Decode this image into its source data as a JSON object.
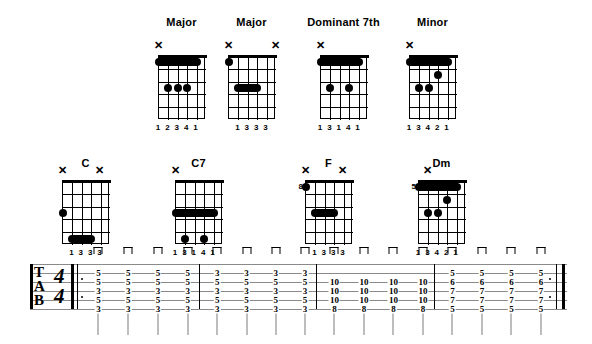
{
  "page": {
    "background": "#ffffff",
    "ink": "#000000",
    "staff_line_color": "#8a8a8a"
  },
  "chord_rows": [
    {
      "row": "shapes",
      "chords": [
        {
          "name": "Major",
          "position_label": "",
          "string_markers": [
            "x",
            "",
            "",
            "",
            "",
            ""
          ],
          "barre": {
            "fret": 1,
            "from_string": 1,
            "to_string": 5
          },
          "dots": [
            {
              "string": 2,
              "fret": 3
            },
            {
              "string": 3,
              "fret": 3
            },
            {
              "string": 4,
              "fret": 3
            }
          ],
          "fingering": [
            "1",
            "2",
            "3",
            "4",
            "1"
          ]
        },
        {
          "name": "Major",
          "position_label": "",
          "string_markers": [
            "x",
            "",
            "",
            "",
            "",
            "x"
          ],
          "barre": {
            "fret": 3,
            "from_string": 2,
            "to_string": 4
          },
          "dots": [
            {
              "string": 1,
              "fret": 1
            }
          ],
          "fingering": [
            "1",
            "3",
            "3",
            "3"
          ]
        },
        {
          "name": "Dominant 7th",
          "position_label": "",
          "string_markers": [
            "x",
            "",
            "",
            "",
            "",
            ""
          ],
          "barre": {
            "fret": 1,
            "from_string": 1,
            "to_string": 5
          },
          "dots": [
            {
              "string": 2,
              "fret": 3
            },
            {
              "string": 4,
              "fret": 3
            }
          ],
          "fingering": [
            "1",
            "3",
            "1",
            "4",
            "1"
          ]
        },
        {
          "name": "Minor",
          "position_label": "",
          "string_markers": [
            "x",
            "",
            "",
            "",
            "",
            ""
          ],
          "barre": {
            "fret": 1,
            "from_string": 1,
            "to_string": 5
          },
          "dots": [
            {
              "string": 2,
              "fret": 3
            },
            {
              "string": 3,
              "fret": 3
            },
            {
              "string": 4,
              "fret": 2
            }
          ],
          "fingering": [
            "1",
            "3",
            "4",
            "2",
            "1"
          ]
        }
      ]
    },
    {
      "row": "named",
      "chords": [
        {
          "name": "C",
          "position_label": "",
          "string_markers": [
            "x",
            "",
            "",
            "",
            "x",
            ""
          ],
          "barre": {
            "fret": 5,
            "from_string": 2,
            "to_string": 4
          },
          "dots": [
            {
              "string": 1,
              "fret": 3
            }
          ],
          "fingering": [
            "1",
            "3",
            "3",
            "3"
          ]
        },
        {
          "name": "C7",
          "position_label": "",
          "string_markers": [
            "x",
            "",
            "",
            "",
            "",
            ""
          ],
          "barre": {
            "fret": 3,
            "from_string": 1,
            "to_string": 5
          },
          "dots": [
            {
              "string": 2,
              "fret": 5
            },
            {
              "string": 4,
              "fret": 5
            }
          ],
          "fingering": [
            "1",
            "3",
            "1",
            "4",
            "1"
          ]
        },
        {
          "name": "F",
          "position_label": "8",
          "string_markers": [
            "x",
            "",
            "",
            "",
            "x",
            ""
          ],
          "barre": {
            "fret": 3,
            "from_string": 2,
            "to_string": 4
          },
          "dots": [
            {
              "string": 1,
              "fret": 1
            }
          ],
          "fingering": [
            "1",
            "3",
            "3",
            "3"
          ]
        },
        {
          "name": "Dm",
          "position_label": "5",
          "string_markers": [
            "",
            "x",
            "",
            "",
            "",
            ""
          ],
          "barre": {
            "fret": 1,
            "from_string": 1,
            "to_string": 5
          },
          "dots": [
            {
              "string": 2,
              "fret": 3
            },
            {
              "string": 3,
              "fret": 3
            },
            {
              "string": 4,
              "fret": 2
            }
          ],
          "fingering": [
            "1",
            "3",
            "4",
            "2",
            "1"
          ]
        }
      ]
    }
  ],
  "tab": {
    "clef": [
      "T",
      "A",
      "B"
    ],
    "time_signature": {
      "top": "4",
      "bottom": "4"
    },
    "repeat_start": true,
    "repeat_end": true,
    "strings": 6,
    "measures": [
      {
        "index": 1,
        "chord_ref": "C",
        "beats": [
          {
            "strum": "down",
            "frets": [
              "5",
              "5",
              "3",
              "5",
              "3"
            ]
          },
          {
            "strum": "down",
            "frets": [
              "5",
              "5",
              "3",
              "5",
              "3"
            ]
          },
          {
            "strum": "down",
            "frets": [
              "5",
              "5",
              "3",
              "5",
              "3"
            ]
          },
          {
            "strum": "down",
            "frets": [
              "5",
              "5",
              "3",
              "5",
              "3"
            ]
          }
        ]
      },
      {
        "index": 2,
        "chord_ref": "C7",
        "beats": [
          {
            "strum": "down",
            "frets": [
              "3",
              "5",
              "3",
              "5",
              "3"
            ]
          },
          {
            "strum": "down",
            "frets": [
              "3",
              "5",
              "3",
              "5",
              "3"
            ]
          },
          {
            "strum": "down",
            "frets": [
              "3",
              "5",
              "3",
              "5",
              "3"
            ]
          },
          {
            "strum": "down",
            "frets": [
              "3",
              "5",
              "3",
              "5",
              "3"
            ]
          }
        ]
      },
      {
        "index": 3,
        "chord_ref": "F",
        "beats": [
          {
            "strum": "down",
            "frets": [
              "10",
              "10",
              "10",
              "8"
            ]
          },
          {
            "strum": "down",
            "frets": [
              "10",
              "10",
              "10",
              "8"
            ]
          },
          {
            "strum": "down",
            "frets": [
              "10",
              "10",
              "10",
              "8"
            ]
          },
          {
            "strum": "down",
            "frets": [
              "10",
              "10",
              "10",
              "8"
            ]
          }
        ]
      },
      {
        "index": 4,
        "chord_ref": "Dm",
        "beats": [
          {
            "strum": "down",
            "frets": [
              "5",
              "6",
              "7",
              "7",
              "5"
            ]
          },
          {
            "strum": "down",
            "frets": [
              "5",
              "6",
              "7",
              "7",
              "5"
            ]
          },
          {
            "strum": "down",
            "frets": [
              "5",
              "6",
              "7",
              "7",
              "5"
            ]
          },
          {
            "strum": "down",
            "frets": [
              "5",
              "6",
              "7",
              "7",
              "5"
            ]
          }
        ]
      }
    ]
  }
}
